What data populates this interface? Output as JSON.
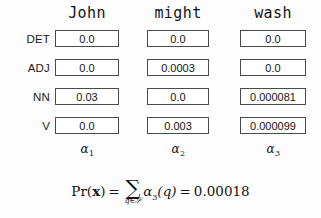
{
  "figure": {
    "type": "forward-algorithm-trellis-table",
    "columns": [
      {
        "word": "John",
        "alpha_label": "α",
        "alpha_subscript": "1"
      },
      {
        "word": "might",
        "alpha_label": "α",
        "alpha_subscript": "2"
      },
      {
        "word": "wash",
        "alpha_label": "α",
        "alpha_subscript": "3"
      }
    ],
    "row_labels": [
      "DET",
      "ADJ",
      "NN",
      "V"
    ],
    "cells": [
      [
        "0.0",
        "0.0",
        "0.0"
      ],
      [
        "0.0",
        "0.0003",
        "0.0"
      ],
      [
        "0.03",
        "0.0",
        "0.000081"
      ],
      [
        "0.0",
        "0.003",
        "0.000099"
      ]
    ],
    "formula": {
      "lhs_function": "Pr",
      "lhs_open": "(",
      "lhs_arg": "x",
      "lhs_close": ")",
      "equals": "=",
      "sum_symbol": "∑",
      "sum_subscript": "q∈𝒮",
      "summand": "α",
      "summand_subscript": "3",
      "summand_arg": "(q)",
      "equals2": "=",
      "result": "0.00018"
    },
    "colors": {
      "background": "#fdfdfd",
      "text": "#141414",
      "cell_border": "#4a4a4a",
      "cell_fill": "#ffffff"
    }
  }
}
